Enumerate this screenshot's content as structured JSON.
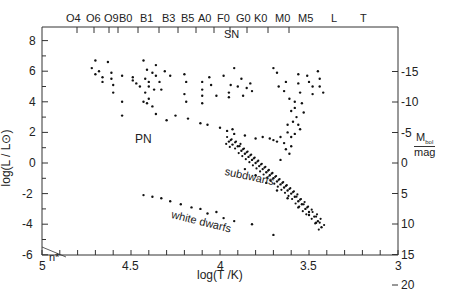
{
  "chart_data": {
    "type": "scatter",
    "title": "",
    "xlabel": "log(T /K)",
    "ylabel": "log(L / L⊙)",
    "y2label": "M_bol / mag",
    "y2label_main": "M",
    "y2label_sub": "bol",
    "y2label_unit": "mag",
    "xlim": [
      5,
      3
    ],
    "ylim": [
      -6,
      8.6
    ],
    "y2lim": [
      20,
      -15
    ],
    "x_ticks": [
      "5",
      "4.5",
      "4",
      "3.5",
      "3"
    ],
    "y_ticks": [
      "8",
      "6",
      "4",
      "2",
      "0",
      "-2",
      "-4",
      "-6"
    ],
    "y2_ticks": [
      "-15",
      "-10",
      "-5",
      "0",
      "5",
      "10",
      "15",
      "20"
    ],
    "spectral_types": [
      "O4",
      "O6",
      "O9",
      "B0",
      "B1",
      "B3",
      "B5",
      "A0",
      "F0",
      "G0",
      "K0",
      "M0",
      "M5",
      "L",
      "T"
    ],
    "annotations": [
      "SN",
      "PN",
      "subdwarfs",
      "white dwarfs",
      "n*"
    ],
    "grid": false,
    "series": [
      {
        "name": "supergiants/giants (upper)",
        "points": [
          [
            4.7,
            6.7
          ],
          [
            4.63,
            6.6
          ],
          [
            4.72,
            6.2
          ],
          [
            4.68,
            6.0
          ],
          [
            4.61,
            5.9
          ],
          [
            4.7,
            5.8
          ],
          [
            4.66,
            5.6
          ],
          [
            4.61,
            5.5
          ],
          [
            4.6,
            5.1
          ],
          [
            4.66,
            5.3
          ],
          [
            4.6,
            4.6
          ],
          [
            4.55,
            5.7
          ],
          [
            4.55,
            4.0
          ],
          [
            4.55,
            3.1
          ],
          [
            4.49,
            5.4
          ],
          [
            4.47,
            5.2
          ],
          [
            4.43,
            6.7
          ],
          [
            4.41,
            6.1
          ],
          [
            4.36,
            6.4
          ],
          [
            4.38,
            5.9
          ],
          [
            4.42,
            5.5
          ],
          [
            4.4,
            5.3
          ],
          [
            4.4,
            5.0
          ],
          [
            4.37,
            4.8
          ],
          [
            4.42,
            4.6
          ],
          [
            4.43,
            4.0
          ],
          [
            4.41,
            3.9
          ],
          [
            4.38,
            3.7
          ],
          [
            4.36,
            5.7
          ],
          [
            4.34,
            5.3
          ],
          [
            4.33,
            4.8
          ],
          [
            4.4,
            4.2
          ],
          [
            4.36,
            3.2
          ],
          [
            4.45,
            5.0
          ],
          [
            4.49,
            5.6
          ],
          [
            4.31,
            6.0
          ],
          [
            4.28,
            5.7
          ],
          [
            4.2,
            5.8
          ],
          [
            4.19,
            5.3
          ],
          [
            4.2,
            4.5
          ],
          [
            4.19,
            4.0
          ],
          [
            4.1,
            5.3
          ],
          [
            4.1,
            4.8
          ],
          [
            4.1,
            4.4
          ],
          [
            4.1,
            3.9
          ],
          [
            4.02,
            4.4
          ],
          [
            4.05,
            5.1
          ],
          [
            4.06,
            5.6
          ],
          [
            3.98,
            5.7
          ],
          [
            3.95,
            4.6
          ],
          [
            3.95,
            4.3
          ],
          [
            3.94,
            5.1
          ],
          [
            3.92,
            6.2
          ],
          [
            3.88,
            5.5
          ],
          [
            3.9,
            5.0
          ],
          [
            3.87,
            4.4
          ],
          [
            3.85,
            4.9
          ],
          [
            3.83,
            5.2
          ],
          [
            3.82,
            4.7
          ],
          [
            3.7,
            6.2
          ],
          [
            3.68,
            5.9
          ],
          [
            3.67,
            5.0
          ],
          [
            3.63,
            5.3
          ],
          [
            3.64,
            4.7
          ],
          [
            3.61,
            4.2
          ],
          [
            3.58,
            3.6
          ],
          [
            3.56,
            5.8
          ],
          [
            3.56,
            5.2
          ],
          [
            3.55,
            4.6
          ],
          [
            3.51,
            5.7
          ],
          [
            3.5,
            5.3
          ],
          [
            3.48,
            5.0
          ],
          [
            3.48,
            4.5
          ],
          [
            3.45,
            6.0
          ],
          [
            3.44,
            5.5
          ],
          [
            3.44,
            5.0
          ],
          [
            3.42,
            4.6
          ],
          [
            3.58,
            4.0
          ],
          [
            3.6,
            3.4
          ],
          [
            3.57,
            3.0
          ],
          [
            3.53,
            3.3
          ],
          [
            3.54,
            3.9
          ]
        ]
      },
      {
        "name": "giant branch / bridge",
        "points": [
          [
            4.3,
            2.8
          ],
          [
            4.25,
            3.1
          ],
          [
            4.18,
            2.9
          ],
          [
            4.11,
            2.6
          ],
          [
            4.07,
            2.5
          ],
          [
            4.0,
            2.3
          ],
          [
            3.96,
            2.1
          ],
          [
            3.92,
            1.9
          ],
          [
            3.93,
            2.2
          ],
          [
            3.86,
            1.8
          ],
          [
            3.8,
            1.6
          ],
          [
            3.76,
            1.7
          ],
          [
            3.72,
            1.6
          ],
          [
            3.7,
            1.5
          ],
          [
            3.68,
            1.4
          ],
          [
            3.66,
            1.7
          ],
          [
            3.64,
            1.3
          ],
          [
            3.62,
            2.0
          ],
          [
            3.6,
            1.7
          ],
          [
            3.58,
            1.9
          ],
          [
            3.62,
            2.5
          ],
          [
            3.59,
            2.7
          ],
          [
            3.56,
            2.5
          ],
          [
            3.55,
            2.2
          ],
          [
            3.6,
            1.1
          ],
          [
            3.63,
            0.9
          ],
          [
            3.61,
            0.6
          ],
          [
            3.66,
            0.2
          ]
        ]
      },
      {
        "name": "main sequence",
        "points": [
          [
            3.95,
            1.4
          ],
          [
            3.93,
            1.2
          ],
          [
            3.9,
            1.1
          ],
          [
            3.88,
            0.8
          ],
          [
            3.86,
            0.6
          ],
          [
            3.84,
            0.4
          ],
          [
            3.82,
            0.2
          ],
          [
            3.8,
            0.0
          ],
          [
            3.78,
            -0.2
          ],
          [
            3.76,
            -0.4
          ],
          [
            3.74,
            -0.6
          ],
          [
            3.72,
            -0.8
          ],
          [
            3.7,
            -1.0
          ],
          [
            3.68,
            -1.2
          ],
          [
            3.66,
            -1.4
          ],
          [
            3.64,
            -1.6
          ],
          [
            3.62,
            -1.8
          ],
          [
            3.6,
            -2.0
          ],
          [
            3.58,
            -2.2
          ],
          [
            3.56,
            -2.5
          ],
          [
            3.54,
            -2.7
          ],
          [
            3.52,
            -3.0
          ],
          [
            3.5,
            -3.2
          ],
          [
            3.47,
            -3.5
          ],
          [
            3.45,
            -3.8
          ],
          [
            3.43,
            -4.2
          ]
        ]
      },
      {
        "name": "subdwarfs",
        "points": [
          [
            3.86,
            -0.4
          ],
          [
            3.8,
            -0.8
          ],
          [
            3.74,
            -1.3
          ],
          [
            3.68,
            -1.8
          ],
          [
            3.62,
            -2.3
          ],
          [
            3.56,
            -2.9
          ],
          [
            3.5,
            -3.4
          ],
          [
            3.46,
            -3.9
          ]
        ]
      },
      {
        "name": "white dwarfs",
        "points": [
          [
            4.43,
            -2.1
          ],
          [
            4.38,
            -2.2
          ],
          [
            4.33,
            -2.3
          ],
          [
            4.28,
            -2.5
          ],
          [
            4.22,
            -2.7
          ],
          [
            4.16,
            -2.9
          ],
          [
            4.11,
            -3.0
          ],
          [
            4.07,
            -3.3
          ],
          [
            4.02,
            -3.2
          ],
          [
            3.98,
            -3.6
          ],
          [
            3.92,
            -3.8
          ],
          [
            3.82,
            -4.0
          ],
          [
            3.7,
            -4.7
          ]
        ]
      },
      {
        "name": "neutron stars (n*)",
        "points": [
          [
            5.0,
            -4.5
          ]
        ]
      }
    ]
  }
}
